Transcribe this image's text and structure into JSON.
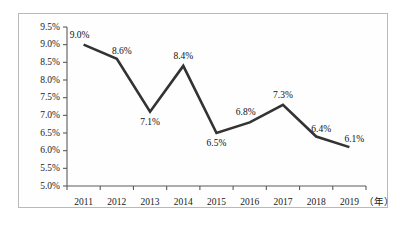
{
  "chart_data": {
    "type": "line",
    "title": "",
    "subtitle": "",
    "xlabel": "（年）",
    "ylabel": "",
    "categories": [
      "2011",
      "2012",
      "2013",
      "2014",
      "2015",
      "2016",
      "2017",
      "2018",
      "2019"
    ],
    "values": [
      9.0,
      8.6,
      7.1,
      8.4,
      6.5,
      6.8,
      7.3,
      6.4,
      6.1
    ],
    "point_labels": [
      "9.0%",
      "8.6%",
      "7.1%",
      "8.4%",
      "6.5%",
      "6.8%",
      "7.3%",
      "6.4%",
      "6.1%"
    ],
    "label_positions": [
      "above-left",
      "above-right",
      "below",
      "above",
      "below",
      "above-left",
      "above",
      "above-right",
      "above-right"
    ],
    "ylim": [
      5.0,
      9.5
    ],
    "ytick_values": [
      5.0,
      5.5,
      6.0,
      6.5,
      7.0,
      7.5,
      8.0,
      8.5,
      9.0,
      9.5
    ],
    "ytick_labels": [
      "5.0%",
      "5.5%",
      "6.0%",
      "6.5%",
      "7.0%",
      "7.5%",
      "8.0%",
      "8.5%",
      "9.0%",
      "9.5%"
    ],
    "grid": false,
    "legend": "none",
    "series": [
      {
        "name": "",
        "values": [
          9.0,
          8.6,
          7.1,
          8.4,
          6.5,
          6.8,
          7.3,
          6.4,
          6.1
        ]
      }
    ],
    "line_color": "#333333",
    "axis_color": "#5a5a5a",
    "border_color": "#b9b9b9",
    "background_color": "#ffffff"
  }
}
